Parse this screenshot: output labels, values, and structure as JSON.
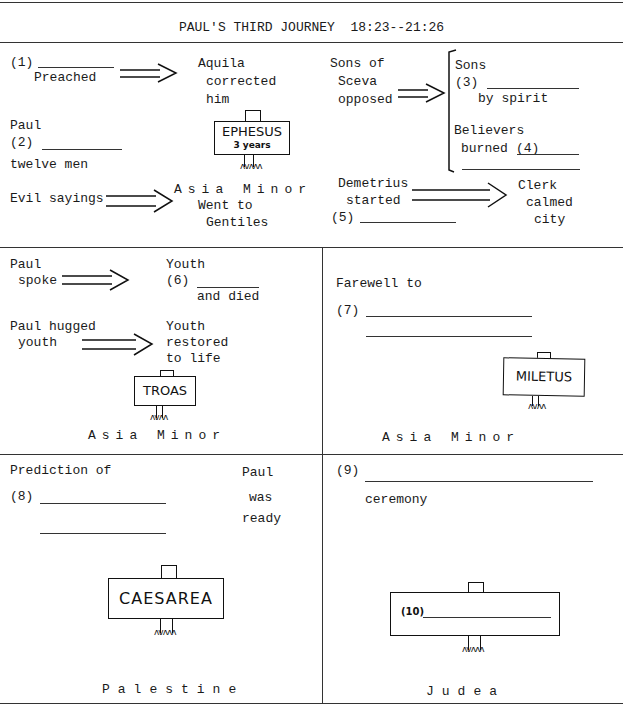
{
  "title": "PAUL'S THIRD JOURNEY  18:23--21:26",
  "ephesus_section": {
    "item1": {
      "num": "(1)",
      "text": "Preached"
    },
    "aquila": [
      "Aquila",
      "corrected",
      "him"
    ],
    "sceva": [
      "Sons of",
      "Sceva",
      "opposed"
    ],
    "bracket": {
      "sons": "Sons",
      "num3": "(3)",
      "by_spirit": "by spirit",
      "believers": "Believers",
      "burned": "burned",
      "num4": "(4)"
    },
    "paul": "Paul",
    "num2": "(2)",
    "twelve_men": "twelve men",
    "sign": {
      "name": "EPHESUS",
      "sub": "3 years"
    },
    "evil_sayings": "Evil sayings",
    "region": "Asia Minor",
    "went_to": [
      "Went to",
      "Gentiles"
    ],
    "demetrius": [
      "Demetrius",
      "started"
    ],
    "num5": "(5)",
    "clerk": [
      "Clerk",
      "calmed",
      "city"
    ]
  },
  "troas_section": {
    "paul_spoke": [
      "Paul",
      "spoke"
    ],
    "youth_died": {
      "line1": "Youth",
      "num": "(6)",
      "line3": "and died"
    },
    "paul_hugged": [
      "Paul hugged",
      "youth"
    ],
    "youth_restored": [
      "Youth",
      "restored",
      "to life"
    ],
    "sign": "TROAS",
    "region": "Asia Minor"
  },
  "miletus_section": {
    "farewell": "Farewell to",
    "num7": "(7)",
    "sign": "MILETUS",
    "region": "Asia Minor"
  },
  "caesarea_section": {
    "prediction": "Prediction of",
    "num8": "(8)",
    "paul_ready": [
      "Paul",
      "was",
      "ready"
    ],
    "sign": "CAESAREA",
    "region": "Palestine"
  },
  "judea_section": {
    "num9": "(9)",
    "ceremony": "ceremony",
    "sign_num": "(10)",
    "region": "Judea"
  }
}
